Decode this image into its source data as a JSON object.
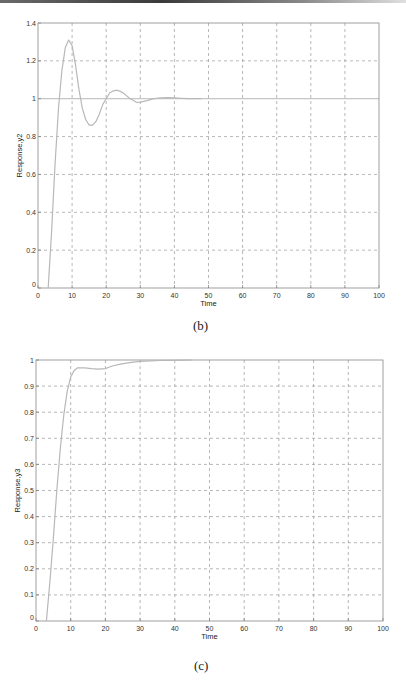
{
  "chart_data": [
    {
      "type": "line",
      "panel": "(b)",
      "title": "",
      "xlabel": "Time",
      "ylabel": "Response,y2",
      "xlim": [
        0,
        100
      ],
      "ylim": [
        0,
        1.4
      ],
      "xticks": [
        0,
        10,
        20,
        30,
        40,
        50,
        60,
        70,
        80,
        90,
        100
      ],
      "yticks": [
        0,
        0.2,
        0.4,
        0.6,
        0.8,
        1,
        1.2,
        1.4
      ],
      "ytick_labels": [
        "0",
        "0.2",
        "0.4",
        "0.6",
        "0.8",
        "1",
        "1.2",
        "1.4"
      ],
      "grid": true,
      "reference_line": 1,
      "series": [
        {
          "name": "y2",
          "x": [
            3,
            4,
            5,
            6,
            7,
            8,
            9,
            10,
            11,
            12,
            13,
            14,
            15,
            16,
            17,
            18,
            19,
            20,
            21,
            22,
            23,
            24,
            25,
            26,
            27,
            28,
            29,
            30,
            32,
            34,
            36,
            38,
            40,
            42,
            44,
            46,
            48
          ],
          "y": [
            0,
            0.3,
            0.65,
            0.95,
            1.15,
            1.27,
            1.31,
            1.28,
            1.18,
            1.05,
            0.95,
            0.89,
            0.86,
            0.86,
            0.88,
            0.92,
            0.97,
            1.0,
            1.03,
            1.04,
            1.045,
            1.04,
            1.03,
            1.015,
            1.0,
            0.99,
            0.98,
            0.982,
            0.99,
            1.0,
            1.005,
            1.006,
            1.005,
            1.002,
            1.0,
            1.0,
            1.0
          ]
        }
      ]
    },
    {
      "type": "line",
      "panel": "(c)",
      "title": "",
      "xlabel": "Time",
      "ylabel": "Response,y3",
      "xlim": [
        0,
        100
      ],
      "ylim": [
        0,
        1
      ],
      "xticks": [
        0,
        10,
        20,
        30,
        40,
        50,
        60,
        70,
        80,
        90,
        100
      ],
      "yticks": [
        0,
        0.1,
        0.2,
        0.3,
        0.4,
        0.5,
        0.6,
        0.7,
        0.8,
        0.9,
        1
      ],
      "ytick_labels": [
        "0",
        "0.1",
        "0.2",
        "0.3",
        "0.4",
        "0.5",
        "0.6",
        "0.7",
        "0.8",
        "0.9",
        "1"
      ],
      "grid": true,
      "series": [
        {
          "name": "y3",
          "x": [
            3,
            4,
            5,
            6,
            7,
            8,
            9,
            10,
            11,
            12,
            14,
            16,
            18,
            20,
            21,
            22,
            24,
            26,
            28,
            30,
            33,
            36,
            40,
            45
          ],
          "y": [
            0,
            0.15,
            0.32,
            0.5,
            0.66,
            0.79,
            0.88,
            0.935,
            0.96,
            0.97,
            0.97,
            0.967,
            0.965,
            0.967,
            0.972,
            0.977,
            0.983,
            0.988,
            0.992,
            0.995,
            0.997,
            0.998,
            0.999,
            1.0
          ]
        }
      ]
    }
  ],
  "figures": {
    "b": {
      "caption": "(b)",
      "xlabel": "Time",
      "ylabel": "Response,y2"
    },
    "c": {
      "caption": "(c)",
      "xlabel": "Time",
      "ylabel": "Response,y3"
    }
  }
}
